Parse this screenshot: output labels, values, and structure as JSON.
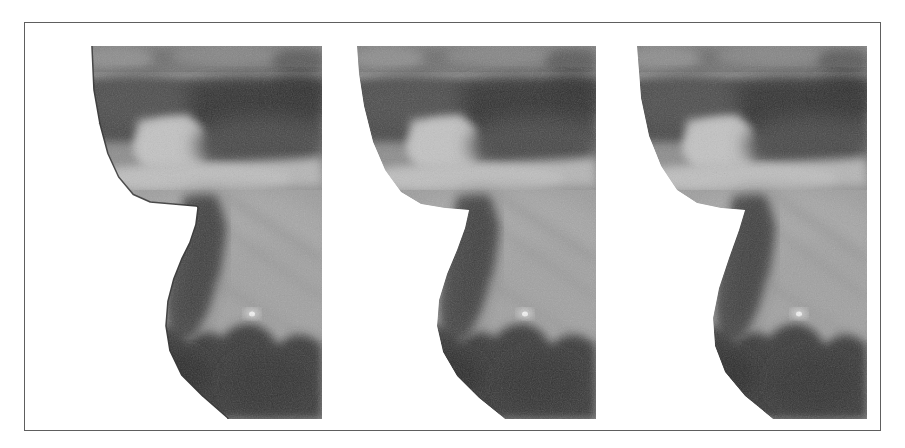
{
  "figure": {
    "caption": "",
    "frame": {
      "border_color": "#5e5e5e",
      "background": "#ffffff",
      "border_width_px": 1
    },
    "panel_count": 3,
    "panels": [
      {
        "id": "panel-1",
        "label": "",
        "position": "left",
        "has_contour_overlay": true,
        "contour_color": "#ffffff",
        "contour_outline_color": "#3a3a3a",
        "contour_style": "polygonal traced boundary",
        "description": "grayscale ultrasound-like image with bright polyline contour traced along the left tissue boundary"
      },
      {
        "id": "panel-2",
        "label": "",
        "position": "center",
        "has_contour_overlay": false,
        "contour_color": "",
        "contour_outline_color": "",
        "contour_style": "none",
        "description": "same grayscale region without an overlaid contour, smooth boundary"
      },
      {
        "id": "panel-3",
        "label": "",
        "position": "right",
        "has_contour_overlay": false,
        "contour_color": "",
        "contour_outline_color": "",
        "contour_style": "none",
        "description": "same grayscale region with a simplified straighter boundary"
      }
    ],
    "palette": {
      "page_background": "#ffffff",
      "frame_line": "#5e5e5e",
      "dark_tissue": "#3b3b3b",
      "mid_tissue": "#6e6e6e",
      "light_tissue": "#a9a9a9",
      "bright_band": "#c8c8c8",
      "highlight_speck": "#e8e8e8",
      "contour_bright": "#fafafa"
    },
    "image_content": {
      "modality": "grayscale scan",
      "bands": [
        {
          "name": "upper-mottled-band",
          "tone": "#8b8b8b"
        },
        {
          "name": "dark-stripe",
          "tone": "#3c3c3c"
        },
        {
          "name": "bright-lobe",
          "tone": "#bdbdbd"
        },
        {
          "name": "mid-gray-body",
          "tone": "#9a9a9a"
        },
        {
          "name": "lower-dark-scallops",
          "tone": "#3a3a3a"
        }
      ],
      "specks": [
        {
          "name": "bright-speck",
          "approx_tone": "#ececec"
        }
      ]
    }
  }
}
